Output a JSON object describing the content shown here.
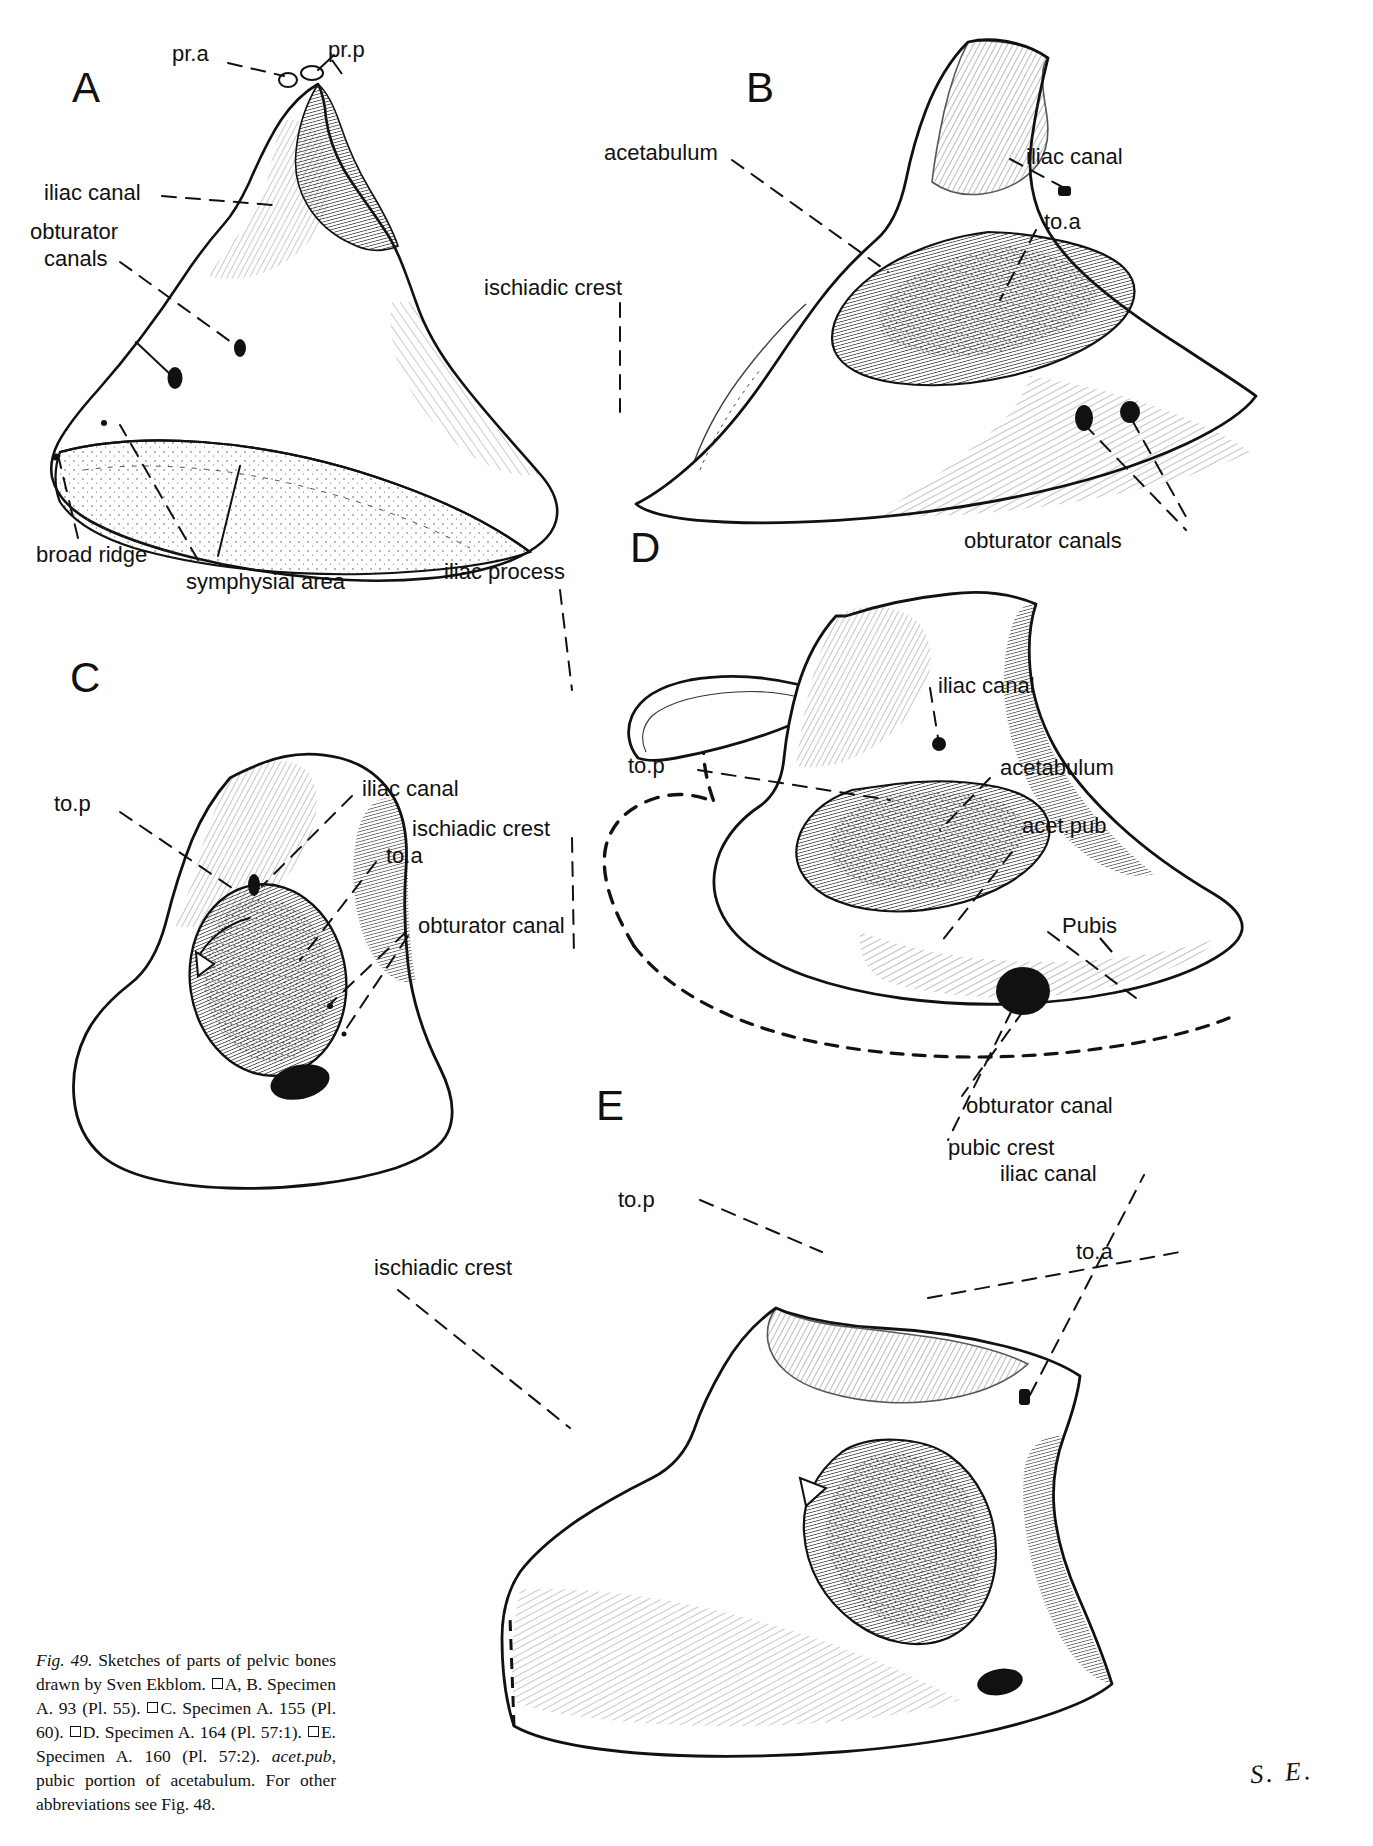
{
  "figure": {
    "id": "Fig. 49",
    "panels": [
      "A",
      "B",
      "C",
      "D",
      "E"
    ],
    "artist_signature": "S. E."
  },
  "top_strip": {
    "text": ""
  },
  "panels": {
    "A": {
      "letter": "A",
      "labels": [
        {
          "key": "pr_a",
          "text": "pr.a"
        },
        {
          "key": "pr_p",
          "text": "pr.p"
        },
        {
          "key": "iliac_canal",
          "text": "iliac canal"
        },
        {
          "key": "obturator_canals_1",
          "text": "obturator"
        },
        {
          "key": "obturator_canals_2",
          "text": "canals"
        },
        {
          "key": "broad_ridge",
          "text": "broad ridge"
        },
        {
          "key": "symphysial_area",
          "text": "symphysial area"
        }
      ]
    },
    "B": {
      "letter": "B",
      "labels": [
        {
          "key": "acetabulum",
          "text": "acetabulum"
        },
        {
          "key": "iliac_canal",
          "text": "iliac canal"
        },
        {
          "key": "to_a",
          "text": "to.a"
        },
        {
          "key": "ischiadic_crest",
          "text": "ischiadic crest"
        },
        {
          "key": "obturator_canals",
          "text": "obturator canals"
        }
      ]
    },
    "C": {
      "letter": "C",
      "labels": [
        {
          "key": "to_p",
          "text": "to.p"
        },
        {
          "key": "iliac_canal",
          "text": "iliac canal"
        },
        {
          "key": "ischiadic_crest",
          "text": "ischiadic crest"
        },
        {
          "key": "to_a",
          "text": "to.a"
        },
        {
          "key": "obturator_canal",
          "text": "obturator canal"
        }
      ]
    },
    "D": {
      "letter": "D",
      "labels": [
        {
          "key": "iliac_process",
          "text": "iliac process"
        },
        {
          "key": "iliac_canal",
          "text": "iliac canal"
        },
        {
          "key": "to_p",
          "text": "to.p"
        },
        {
          "key": "acetabulum",
          "text": "acetabulum"
        },
        {
          "key": "acet_pub",
          "text": "acet.pub"
        },
        {
          "key": "pubis",
          "text": "Pubis"
        },
        {
          "key": "obturator_canal",
          "text": "obturator canal"
        },
        {
          "key": "pubic_crest",
          "text": "pubic crest"
        }
      ]
    },
    "E": {
      "letter": "E",
      "labels": [
        {
          "key": "to_p",
          "text": "to.p"
        },
        {
          "key": "iliac_canal",
          "text": "iliac canal"
        },
        {
          "key": "to_a",
          "text": "to.a"
        },
        {
          "key": "ischiadic_crest",
          "text": "ischiadic crest"
        }
      ]
    }
  },
  "caption": {
    "fig_no": "Fig. 49.",
    "line_1": " Sketches of parts of pelvic bones drawn by Sven Ekblom. ",
    "seg_a": "A, B. Specimen A. 93 (Pl. 55). ",
    "seg_c": "C. Specimen A. 155 (Pl. 60). ",
    "seg_d": "D. Specimen A. 164 (Pl. 57:1). ",
    "seg_e": "E. Specimen A. 160 (Pl. 57:2). ",
    "abbr_term": "acet.pub",
    "abbr_def": ", pubic portion of acetabulum. For other abbreviations see Fig. 48."
  },
  "colors": {
    "ink": "#111111",
    "paper": "#ffffff",
    "hatch": "#2b2b2b"
  }
}
